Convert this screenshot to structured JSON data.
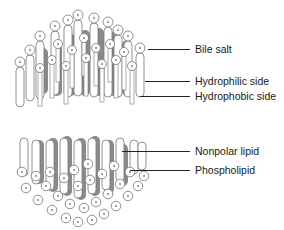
{
  "figure": {
    "colors": {
      "background": "#ffffff",
      "hydrophobic_fill": "#8a8a8a",
      "outline": "#777777",
      "line": "#222222",
      "text": "#1a1a1a"
    },
    "top_structure": {
      "name": "bile-salt-layer",
      "labels": [
        {
          "id": "bile-salt",
          "text": "Bile salt",
          "line_from_x": 148,
          "line_to_x": 190,
          "y": 49,
          "text_x": 195
        },
        {
          "id": "hydrophilic-side",
          "text": "Hydrophilic side",
          "line_from_x": 145,
          "line_to_x": 190,
          "y": 81,
          "text_x": 195
        },
        {
          "id": "hydrophobic-side",
          "text": "Hydrophobic side",
          "line_from_x": 140,
          "line_to_x": 190,
          "y": 96,
          "text_x": 195
        }
      ]
    },
    "bottom_structure": {
      "name": "phospholipid-layer",
      "labels": [
        {
          "id": "nonpolar-lipid",
          "text": "Nonpolar lipid",
          "line_from_x": 122,
          "line_to_x": 190,
          "y": 151,
          "text_x": 195
        },
        {
          "id": "phospholipid",
          "text": "Phospholipid",
          "line_from_x": 130,
          "line_to_x": 190,
          "y": 170,
          "text_x": 195
        }
      ]
    }
  }
}
